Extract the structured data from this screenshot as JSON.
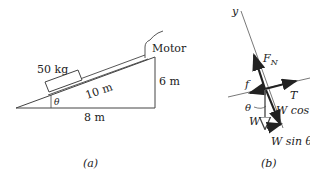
{
  "figure_a": {
    "caption": "(a)",
    "mass_label": "50 kg",
    "hypotenuse_label": "10 m",
    "base_label": "8 m",
    "height_label": "6 m",
    "motor_label": "Motor",
    "angle_label": "θ"
  },
  "figure_b": {
    "caption": "(b)",
    "axis_y_label": "y",
    "normal_force_label": "F",
    "normal_force_sub": "N",
    "tension_label": "T",
    "friction_label": "f",
    "weight_label": "W",
    "weight_cos_label": "W cos",
    "weight_sin_label": "W sin θ",
    "angle_label": "θ"
  },
  "colors": {
    "line": "#333333",
    "text": "#222222",
    "background": "#ffffff"
  }
}
